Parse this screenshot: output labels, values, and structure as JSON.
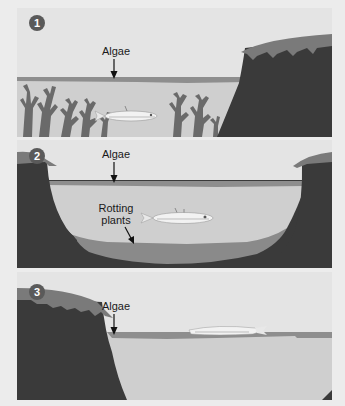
{
  "diagram": {
    "colors": {
      "sky": "#e4e4e4",
      "water": "#cfcfcf",
      "algae_layer": "#8e8e8e",
      "cliff": "#3a3a3a",
      "grass": "#7a7a7a",
      "plants": "#6a6a6a",
      "rotting_layer": "#8a8a8a",
      "badge": "#5a5a5a"
    },
    "panels": [
      {
        "number": "1",
        "labels": [
          {
            "text": "Algae",
            "points_to": "algae-layer-surface"
          }
        ],
        "elements": [
          "algae-layer",
          "seaweed-plants",
          "fish-alive",
          "cliff-right"
        ]
      },
      {
        "number": "2",
        "labels": [
          {
            "text": "Algae",
            "points_to": "algae-layer-surface"
          },
          {
            "text": "Rotting\nplants",
            "points_to": "rotting-plant-layer"
          }
        ],
        "elements": [
          "algae-layer",
          "fish-alive",
          "cliff-left",
          "cliff-right",
          "rotting-plant-layer"
        ]
      },
      {
        "number": "3",
        "labels": [
          {
            "text": "Algae",
            "points_to": "algae-layer-surface"
          }
        ],
        "elements": [
          "algae-layer",
          "dead-fish-floating",
          "cliff-left"
        ]
      }
    ]
  }
}
